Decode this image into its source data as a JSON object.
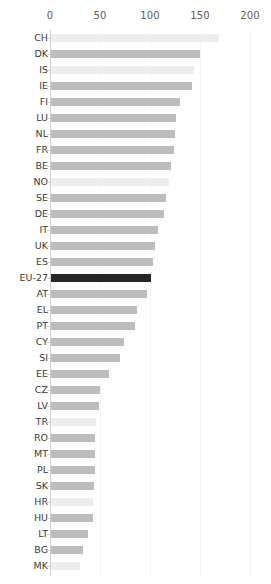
{
  "chart_data": {
    "type": "bar",
    "orientation": "horizontal",
    "title": "",
    "subtitle": "",
    "xlabel": "",
    "ylabel": "",
    "xlim": [
      0,
      200
    ],
    "ylim": null,
    "grid": true,
    "legend": null,
    "legend_position": "none",
    "axis_position": "top",
    "xticks": [
      0,
      50,
      100,
      150,
      200
    ],
    "xtick_labels": [
      "0",
      "50",
      "100",
      "150",
      "200"
    ],
    "categories": [
      "CH",
      "DK",
      "IS",
      "IE",
      "FI",
      "LU",
      "NL",
      "FR",
      "BE",
      "NO",
      "SE",
      "DE",
      "IT",
      "UK",
      "ES",
      "EU-27",
      "AT",
      "EL",
      "PT",
      "CY",
      "SI",
      "EE",
      "CZ",
      "LV",
      "TR",
      "RO",
      "MT",
      "PL",
      "SK",
      "HR",
      "HU",
      "LT",
      "BG",
      "MK"
    ],
    "values": [
      168,
      149,
      143,
      141,
      129,
      125,
      124,
      123,
      120,
      118,
      115,
      113,
      107,
      104,
      102,
      100,
      96,
      86,
      84,
      73,
      69,
      58,
      49,
      48,
      45,
      44,
      44,
      44,
      43,
      42,
      42,
      37,
      32,
      29
    ],
    "bar_styles": [
      "light",
      "mid",
      "light",
      "mid",
      "mid",
      "mid",
      "mid",
      "mid",
      "mid",
      "light",
      "mid",
      "mid",
      "mid",
      "mid",
      "mid",
      "dark",
      "mid",
      "mid",
      "mid",
      "mid",
      "mid",
      "mid",
      "mid",
      "mid",
      "light",
      "mid",
      "mid",
      "mid",
      "mid",
      "light",
      "mid",
      "mid",
      "mid",
      "light"
    ],
    "colors": {
      "light": "#ededed",
      "mid": "#bdbdbd",
      "dark": "#262626",
      "axis": "#cfcfcf",
      "gridline": "#f4f4f4",
      "tick_text": "#5b5b5b",
      "label_text": "#3a3a3a",
      "background": "#ffffff"
    },
    "annotations": []
  },
  "layout": {
    "origin_x": 50,
    "px_per_unit": 1.0,
    "plot_top": 30,
    "row_pitch": 16,
    "bar_height": 8
  }
}
